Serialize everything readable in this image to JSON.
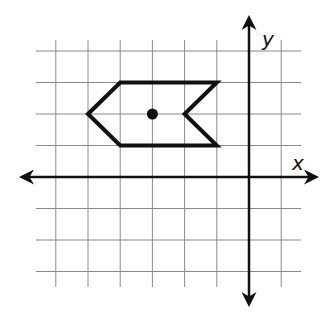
{
  "diagram": {
    "type": "coordinate-plane",
    "axes": {
      "x_label": "x",
      "y_label": "y"
    },
    "grid": {
      "x_range": [
        -6,
        1
      ],
      "y_range": [
        -3,
        4
      ],
      "unit": 1,
      "color": "#888888"
    },
    "figure": {
      "name": "pentagon-arrow-shape",
      "vertices": [
        [
          -5,
          2
        ],
        [
          -4,
          3
        ],
        [
          -1,
          3
        ],
        [
          -2,
          2
        ],
        [
          -1,
          1
        ],
        [
          -4,
          1
        ]
      ],
      "stroke": "#111111"
    },
    "point": {
      "coords": [
        -3,
        2
      ],
      "color": "#111111"
    }
  }
}
